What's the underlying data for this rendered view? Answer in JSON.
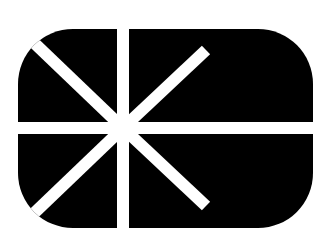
{
  "figure": {
    "type": "logo",
    "description": "Black rounded rectangle with white horizontal and vertical bars crossing off-center, plus white diagonal rays radiating from the intersection",
    "colors": {
      "background": "#ffffff",
      "shape": "#000000",
      "stripes": "#ffffff"
    },
    "shape": {
      "x": 18,
      "y": 29,
      "width": 295,
      "height": 199,
      "corner_radius": 55
    },
    "center": {
      "x": 123,
      "y": 128
    },
    "stripe_width": 12,
    "rays": [
      {
        "name": "upper-left",
        "x2": 30,
        "y2": 36
      },
      {
        "name": "lower-left",
        "x2": 30,
        "y2": 220
      },
      {
        "name": "upper-right",
        "x2": 205,
        "y2": 50
      },
      {
        "name": "lower-right",
        "x2": 205,
        "y2": 206
      }
    ]
  }
}
